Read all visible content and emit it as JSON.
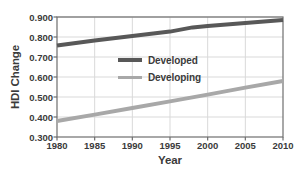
{
  "chart_data": {
    "type": "line",
    "title": "",
    "xlabel": "Year",
    "ylabel": "HDI Change",
    "xlim": [
      1980,
      2010
    ],
    "ylim": [
      0.3,
      0.9
    ],
    "grid": true,
    "legend_position": "inside-center-left",
    "x": [
      1980,
      1985,
      1990,
      1995,
      2000,
      2005,
      2010
    ],
    "x_tick_labels": [
      "1980",
      "1985",
      "1990",
      "1995",
      "2000",
      "2005",
      "2010"
    ],
    "y_tick_values": [
      0.3,
      0.4,
      0.5,
      0.6,
      0.7,
      0.8,
      0.9
    ],
    "y_tick_labels": [
      "0.300",
      "0.400",
      "0.500",
      "0.600",
      "0.700",
      "0.800",
      "0.900"
    ],
    "series": [
      {
        "name": "Developed",
        "color": "#585858",
        "line_width": 4,
        "x": [
          1980,
          1985,
          1990,
          1995,
          1998,
          2000,
          2005,
          2010
        ],
        "values": [
          0.757,
          0.783,
          0.805,
          0.827,
          0.848,
          0.855,
          0.87,
          0.885
        ]
      },
      {
        "name": "Developing",
        "color": "#a8a8a8",
        "line_width": 4,
        "x": [
          1980,
          1985,
          1990,
          1995,
          2000,
          2005,
          2010
        ],
        "values": [
          0.38,
          0.412,
          0.445,
          0.478,
          0.512,
          0.547,
          0.58
        ]
      }
    ],
    "annotations": []
  },
  "axes": {
    "y_title": "HDI Change",
    "x_title": "Year",
    "y_ticks": [
      {
        "label": "0.900",
        "value": 0.9
      },
      {
        "label": "0.800",
        "value": 0.8
      },
      {
        "label": "0.700",
        "value": 0.7
      },
      {
        "label": "0.600",
        "value": 0.6
      },
      {
        "label": "0.500",
        "value": 0.5
      },
      {
        "label": "0.400",
        "value": 0.4
      },
      {
        "label": "0.300",
        "value": 0.3
      }
    ],
    "x_ticks": [
      {
        "label": "1980",
        "value": 1980
      },
      {
        "label": "1985",
        "value": 1985
      },
      {
        "label": "1990",
        "value": 1990
      },
      {
        "label": "1995",
        "value": 1995
      },
      {
        "label": "2000",
        "value": 2000
      },
      {
        "label": "2005",
        "value": 2005
      },
      {
        "label": "2010",
        "value": 2010
      }
    ]
  },
  "legend": {
    "entries": [
      {
        "label": "Developed",
        "color": "#585858"
      },
      {
        "label": "Developing",
        "color": "#a8a8a8"
      }
    ]
  },
  "colors": {
    "developed": "#585858",
    "developing": "#a8a8a8",
    "axis": "#6e6e6e",
    "grid": "#d9d9d9",
    "text": "#3b3b3b",
    "background": "#ffffff"
  }
}
